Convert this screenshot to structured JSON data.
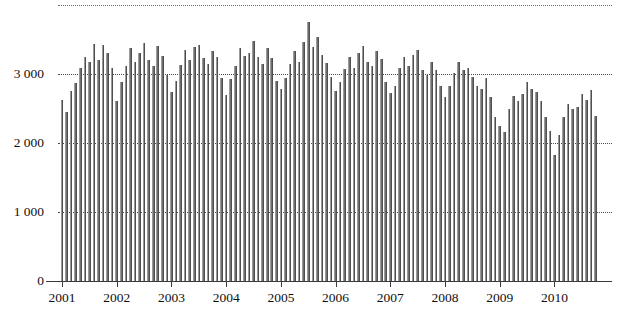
{
  "chart_data": {
    "type": "bar",
    "title": "",
    "subtitle": "",
    "xlabel": "",
    "ylabel": "",
    "ylim": [
      0,
      4000
    ],
    "grid": true,
    "legend": null,
    "y_ticks": [
      0,
      1000,
      2000,
      3000
    ],
    "y_tick_labels": [
      "0",
      "1 000",
      "2 000",
      "3 000"
    ],
    "gridlines": [
      1000,
      2000,
      3000,
      4000
    ],
    "x_tick_labels": [
      "2001",
      "2002",
      "2003",
      "2004",
      "2005",
      "2006",
      "2007",
      "2008",
      "2009",
      "2010"
    ],
    "x_tick_years": [
      2001,
      2002,
      2003,
      2004,
      2005,
      2006,
      2007,
      2008,
      2009,
      2010
    ],
    "bar_color": "#6f6f6f",
    "axis_color": "#3a3a3a",
    "grid_color": "#2b2b2b",
    "background": "#ffffff",
    "frequency": "monthly",
    "start": "2001-01",
    "end": "2010-10",
    "categories": [
      "2001-01",
      "2001-02",
      "2001-03",
      "2001-04",
      "2001-05",
      "2001-06",
      "2001-07",
      "2001-08",
      "2001-09",
      "2001-10",
      "2001-11",
      "2001-12",
      "2002-01",
      "2002-02",
      "2002-03",
      "2002-04",
      "2002-05",
      "2002-06",
      "2002-07",
      "2002-08",
      "2002-09",
      "2002-10",
      "2002-11",
      "2002-12",
      "2003-01",
      "2003-02",
      "2003-03",
      "2003-04",
      "2003-05",
      "2003-06",
      "2003-07",
      "2003-08",
      "2003-09",
      "2003-10",
      "2003-11",
      "2003-12",
      "2004-01",
      "2004-02",
      "2004-03",
      "2004-04",
      "2004-05",
      "2004-06",
      "2004-07",
      "2004-08",
      "2004-09",
      "2004-10",
      "2004-11",
      "2004-12",
      "2005-01",
      "2005-02",
      "2005-03",
      "2005-04",
      "2005-05",
      "2005-06",
      "2005-07",
      "2005-08",
      "2005-09",
      "2005-10",
      "2005-11",
      "2005-12",
      "2006-01",
      "2006-02",
      "2006-03",
      "2006-04",
      "2006-05",
      "2006-06",
      "2006-07",
      "2006-08",
      "2006-09",
      "2006-10",
      "2006-11",
      "2006-12",
      "2007-01",
      "2007-02",
      "2007-03",
      "2007-04",
      "2007-05",
      "2007-06",
      "2007-07",
      "2007-08",
      "2007-09",
      "2007-10",
      "2007-11",
      "2007-12",
      "2008-01",
      "2008-02",
      "2008-03",
      "2008-04",
      "2008-05",
      "2008-06",
      "2008-07",
      "2008-08",
      "2008-09",
      "2008-10",
      "2008-11",
      "2008-12",
      "2009-01",
      "2009-02",
      "2009-03",
      "2009-04",
      "2009-05",
      "2009-06",
      "2009-07",
      "2009-08",
      "2009-09",
      "2009-10",
      "2009-11",
      "2009-12",
      "2010-01",
      "2010-02",
      "2010-03",
      "2010-04",
      "2010-05",
      "2010-06",
      "2010-07",
      "2010-08",
      "2010-09",
      "2010-10"
    ],
    "values": [
      2620,
      2450,
      2760,
      2870,
      3090,
      3240,
      3180,
      3440,
      3210,
      3420,
      3300,
      3080,
      2610,
      2880,
      3110,
      3370,
      3180,
      3300,
      3450,
      3210,
      3120,
      3400,
      3260,
      2980,
      2740,
      2900,
      3130,
      3350,
      3200,
      3390,
      3420,
      3230,
      3150,
      3330,
      3240,
      2940,
      2690,
      2930,
      3110,
      3370,
      3260,
      3300,
      3480,
      3250,
      3140,
      3380,
      3230,
      2900,
      2780,
      2940,
      3150,
      3330,
      3180,
      3460,
      3750,
      3390,
      3540,
      3280,
      3160,
      2960,
      2760,
      2880,
      3070,
      3240,
      3080,
      3300,
      3410,
      3180,
      3120,
      3330,
      3220,
      2880,
      2720,
      2830,
      3080,
      3250,
      3120,
      3280,
      3350,
      3060,
      2990,
      3180,
      3060,
      2820,
      2660,
      2820,
      3010,
      3180,
      3060,
      3090,
      2960,
      2820,
      2780,
      2940,
      2660,
      2380,
      2240,
      2160,
      2490,
      2680,
      2610,
      2710,
      2890,
      2780,
      2740,
      2610,
      2380,
      2180,
      1820,
      2120,
      2380,
      2560,
      2490,
      2520,
      2710,
      2620,
      2770,
      2390
    ]
  },
  "axes": {
    "y_axis_label_values": [
      "3 000",
      "2 000",
      "1 000",
      "0"
    ],
    "x_axis_label_values": [
      "2001",
      "2002",
      "2003",
      "2004",
      "2005",
      "2006",
      "2007",
      "2008",
      "2009",
      "2010"
    ]
  }
}
